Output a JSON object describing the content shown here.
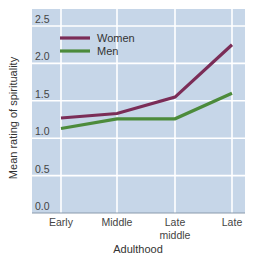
{
  "chart_data": {
    "type": "line",
    "title": "",
    "xlabel": "Adulthood",
    "ylabel": "Mean rating of spirituality",
    "categories": [
      "Early",
      "Middle",
      "Late middle",
      "Late"
    ],
    "category_lines": [
      [
        "Early"
      ],
      [
        "Middle"
      ],
      [
        "Late",
        "middle"
      ],
      [
        "Late"
      ]
    ],
    "ylim": [
      0.0,
      2.5
    ],
    "yticks": [
      0.0,
      0.5,
      1.0,
      1.5,
      2.0,
      2.5
    ],
    "ytick_labels": [
      "0.0",
      "0.5",
      "1.0",
      "1.5",
      "2.0",
      "2.5"
    ],
    "grid": true,
    "legend_position": "upper left inside",
    "series": [
      {
        "name": "Women",
        "color": "#7b2d57",
        "values": [
          1.27,
          1.33,
          1.55,
          2.25
        ]
      },
      {
        "name": "Men",
        "color": "#4c8b3b",
        "values": [
          1.13,
          1.26,
          1.26,
          1.6
        ]
      }
    ]
  },
  "colors": {
    "plot_background": "#c6d6e8",
    "grid": "#ffffff",
    "axis": "#8a9aab"
  }
}
